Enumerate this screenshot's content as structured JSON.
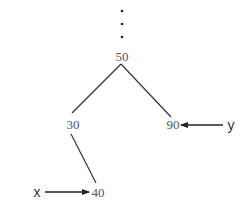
{
  "diagram": {
    "type": "binary-search-tree-fragment",
    "ellipsis": {
      "count": 3,
      "x": 122,
      "ys": [
        11,
        24,
        37
      ]
    },
    "nodes": [
      {
        "id": "n50",
        "label": "50",
        "x": 122,
        "y": 61
      },
      {
        "id": "n30",
        "label": "30",
        "x": 73,
        "y": 129
      },
      {
        "id": "n90",
        "label": "90",
        "x": 173,
        "y": 129
      },
      {
        "id": "n40",
        "label": "40",
        "x": 98,
        "y": 197
      }
    ],
    "edges": [
      {
        "from": "n50",
        "to": "n30"
      },
      {
        "from": "n50",
        "to": "n90"
      },
      {
        "from": "n30",
        "to": "n40"
      }
    ],
    "pointers": [
      {
        "label": "x",
        "target": "n40",
        "direction": "right"
      },
      {
        "label": "y",
        "target": "n90",
        "direction": "left"
      }
    ],
    "colors": {
      "node_text": "#555555",
      "edge": "#333333",
      "pointer": "#222222"
    }
  }
}
